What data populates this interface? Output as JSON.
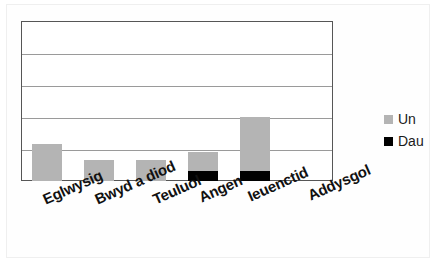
{
  "chart_data": {
    "type": "bar",
    "title": "",
    "subtitle": "",
    "xlabel": "",
    "ylabel": "",
    "stacked": true,
    "grid": true,
    "legend_position": "right",
    "ylim": [
      0,
      5
    ],
    "ytick_values": [
      0,
      1,
      2,
      3,
      4,
      5
    ],
    "ytick_labels": [
      "",
      "",
      "",
      "",
      "",
      ""
    ],
    "categories": [
      "Eglwysig",
      "Bwyd a diod",
      "Teuluol",
      "Angen",
      "Ieuenctid",
      "Addysgol"
    ],
    "series": [
      {
        "name": "Dau",
        "color": "#000000",
        "values": [
          0,
          0,
          0,
          0.3,
          0.32,
          0
        ]
      },
      {
        "name": "Un",
        "color": "#b4b4b4",
        "values": [
          1.17,
          0.66,
          0.66,
          0.61,
          1.68,
          0
        ]
      }
    ],
    "annotations": []
  },
  "legend": {
    "items": [
      {
        "label": "Un",
        "color": "#b4b4b4"
      },
      {
        "label": "Dau",
        "color": "#000000"
      }
    ]
  },
  "axis": {
    "categories": [
      {
        "label": "Eglwysig"
      },
      {
        "label": "Bwyd a diod"
      },
      {
        "label": "Teuluol"
      },
      {
        "label": "Angen"
      },
      {
        "label": "Ieuenctid"
      },
      {
        "label": "Addysgol"
      }
    ]
  },
  "style": {
    "plot_border_color": "#565656",
    "gridline_color": "#9a9a9a",
    "background": "#ffffff"
  }
}
